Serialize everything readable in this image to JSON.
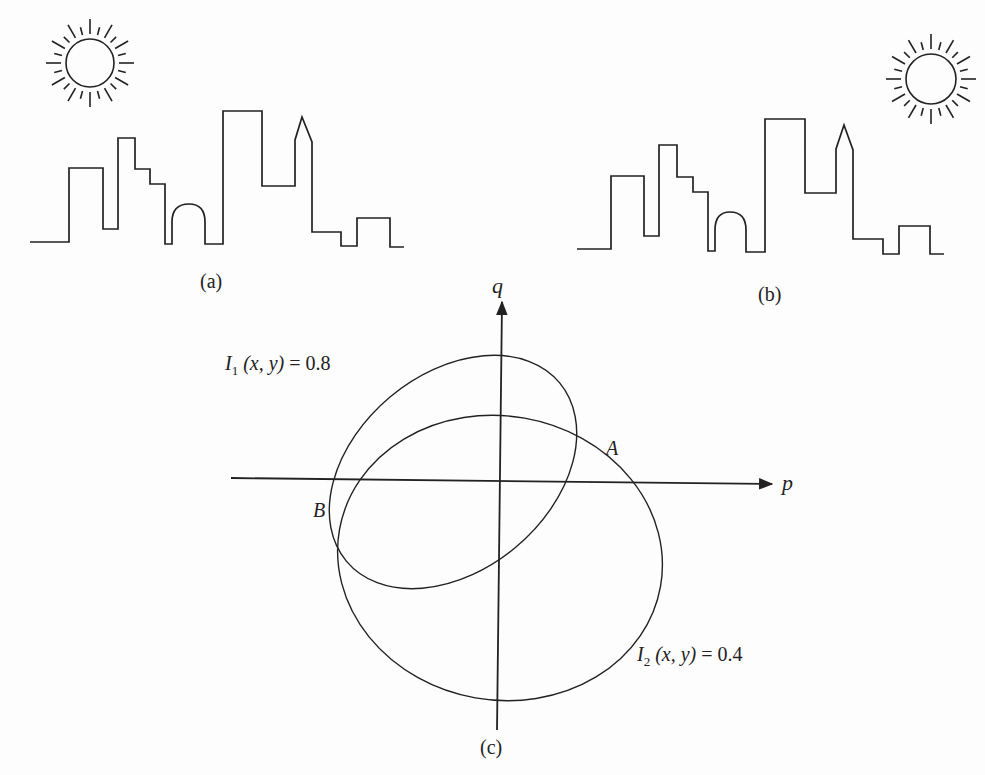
{
  "panels": {
    "a": {
      "caption": "(a)",
      "scene": "city skyline with sun at upper left"
    },
    "b": {
      "caption": "(b)",
      "scene": "city skyline with sun at upper right"
    },
    "c": {
      "caption": "(c)",
      "scene": "gradient-space (p,q) plot of two reflectance-map contours"
    }
  },
  "chart_data": {
    "type": "diagram",
    "title": "",
    "axes": {
      "x_label": "p",
      "y_label": "q",
      "grid": false
    },
    "curves": [
      {
        "name": "I1",
        "label_symbol": "I",
        "label_sub": "1",
        "label_args": "(x, y)",
        "label_eq": "= 0.8",
        "shape": "tilted ellipse"
      },
      {
        "name": "I2",
        "label_symbol": "I",
        "label_sub": "2",
        "label_args": "(x, y)",
        "label_eq": "= 0.4",
        "shape": "ellipse"
      }
    ],
    "intersections": [
      {
        "name": "A",
        "label": "A"
      },
      {
        "name": "B",
        "label": "B"
      }
    ]
  },
  "colors": {
    "ink": "#222222",
    "paper": "#fdfdfd"
  }
}
